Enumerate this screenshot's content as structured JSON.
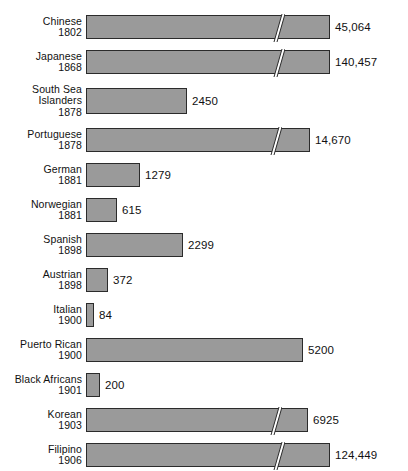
{
  "chart_data": {
    "type": "bar",
    "title": "",
    "subtitle": "",
    "xlabel": "",
    "ylabel": "",
    "orientation": "horizontal",
    "grid": false,
    "legend": null,
    "axis_break": true,
    "axis_break_note": "Diagonal white slash on long bars indicates a scale break (truncated axis).",
    "bar_color": "#9a9a9a",
    "bar_border_color": "#2b2b2b",
    "background_color": "#ffffff",
    "text_color": "#111111",
    "categories": [
      "Chinese 1802",
      "Japanese 1868",
      "South Sea Islanders 1878",
      "Portuguese 1878",
      "German 1881",
      "Norwegian 1881",
      "Spanish 1898",
      "Austrian 1898",
      "Italian 1900",
      "Puerto Rican 1900",
      "Black Africans 1901",
      "Korean 1903",
      "Filipino 1906",
      "American Caucasian 1908",
      "Russian 1909"
    ],
    "values": [
      45064,
      140457,
      2450,
      14670,
      1279,
      615,
      2299,
      372,
      84,
      5200,
      200,
      6925,
      124449,
      100,
      110
    ],
    "value_labels": [
      "45,064",
      "140,457",
      "2450",
      "14,670",
      "1279",
      "615",
      "2299",
      "372",
      "84",
      "5200",
      "200",
      "6925",
      "124,449",
      "100",
      "110"
    ],
    "bars": [
      {
        "name_lines": [
          "Chinese"
        ],
        "year": "1802",
        "value": 45064,
        "value_label": "45,064",
        "pixel_width": 244,
        "broken": true,
        "break_at_px": 185
      },
      {
        "name_lines": [
          "Japanese"
        ],
        "year": "1868",
        "value": 140457,
        "value_label": "140,457",
        "pixel_width": 244,
        "broken": true,
        "break_at_px": 185
      },
      {
        "name_lines": [
          "South Sea",
          "Islanders"
        ],
        "year": "1878",
        "value": 2450,
        "value_label": "2450",
        "pixel_width": 101,
        "broken": false,
        "break_at_px": null
      },
      {
        "name_lines": [
          "Portuguese"
        ],
        "year": "1878",
        "value": 14670,
        "value_label": "14,670",
        "pixel_width": 224,
        "broken": true,
        "break_at_px": 182
      },
      {
        "name_lines": [
          "German"
        ],
        "year": "1881",
        "value": 1279,
        "value_label": "1279",
        "pixel_width": 54,
        "broken": false,
        "break_at_px": null
      },
      {
        "name_lines": [
          "Norwegian"
        ],
        "year": "1881",
        "value": 615,
        "value_label": "615",
        "pixel_width": 31,
        "broken": false,
        "break_at_px": null
      },
      {
        "name_lines": [
          "Spanish"
        ],
        "year": "1898",
        "value": 2299,
        "value_label": "2299",
        "pixel_width": 97,
        "broken": false,
        "break_at_px": null
      },
      {
        "name_lines": [
          "Austrian"
        ],
        "year": "1898",
        "value": 372,
        "value_label": "372",
        "pixel_width": 22,
        "broken": false,
        "break_at_px": null
      },
      {
        "name_lines": [
          "Italian"
        ],
        "year": "1900",
        "value": 84,
        "value_label": "84",
        "pixel_width": 8,
        "broken": false,
        "break_at_px": null
      },
      {
        "name_lines": [
          "Puerto Rican"
        ],
        "year": "1900",
        "value": 5200,
        "value_label": "5200",
        "pixel_width": 217,
        "broken": false,
        "break_at_px": null
      },
      {
        "name_lines": [
          "Black Africans"
        ],
        "year": "1901",
        "value": 200,
        "value_label": "200",
        "pixel_width": 14,
        "broken": false,
        "break_at_px": null
      },
      {
        "name_lines": [
          "Korean"
        ],
        "year": "1903",
        "value": 6925,
        "value_label": "6925",
        "pixel_width": 222,
        "broken": true,
        "break_at_px": 182
      },
      {
        "name_lines": [
          "Filipino"
        ],
        "year": "1906",
        "value": 124449,
        "value_label": "124,449",
        "pixel_width": 244,
        "broken": true,
        "break_at_px": 185
      },
      {
        "name_lines": [
          "American",
          "Caucasian"
        ],
        "year": "1908",
        "value": 100,
        "value_label": "100",
        "pixel_width": 9,
        "broken": false,
        "break_at_px": null
      },
      {
        "name_lines": [
          "Russian"
        ],
        "year": "1909",
        "value": 110,
        "value_label": "110",
        "pixel_width": 10,
        "broken": false,
        "break_at_px": null
      }
    ]
  }
}
